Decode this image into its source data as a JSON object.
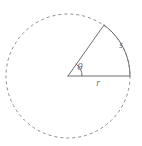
{
  "figure": {
    "type": "geometry-diagram",
    "width": 142,
    "height": 146,
    "background_color": "#ffffff",
    "stroke_color": "#6f6f72",
    "dashed_stroke_color": "#8d8d90"
  },
  "circle": {
    "name": "dashed-circle",
    "center_x": 68,
    "center_y": 76,
    "radius": 62,
    "style": "dashed",
    "dash_pattern": "3 3",
    "stroke_width": 1,
    "color": "#8d8d90"
  },
  "sector": {
    "name": "sector",
    "center_x": 68,
    "center_y": 76,
    "radius": 62,
    "start_angle_deg": 0,
    "end_angle_deg": 55,
    "radius_line_horizontal": {
      "x1": 68,
      "y1": 76,
      "x2": 130,
      "y2": 76
    },
    "radius_line_angled": {
      "x1": 68,
      "y1": 76,
      "x2": 104,
      "y2": 25
    },
    "arc_path": "M 130 76 A 62 62 0 0 0 104 25",
    "stroke_width": 1,
    "color": "#6f6f72"
  },
  "angle_marker": {
    "name": "angle-arc-marker",
    "center_x": 68,
    "center_y": 76,
    "radius": 14,
    "path": "M 82 76 A 14 14 0 0 0 76 64",
    "color": "#6f6f72"
  },
  "labels": {
    "theta": {
      "text": "θ",
      "x": 80,
      "y": 70,
      "meaning": "central angle theta"
    },
    "arc_length": {
      "text": "s",
      "x": 121,
      "y": 48,
      "meaning": "arc length s"
    },
    "radius": {
      "text": "r",
      "x": 98,
      "y": 86,
      "meaning": "radius r"
    }
  }
}
